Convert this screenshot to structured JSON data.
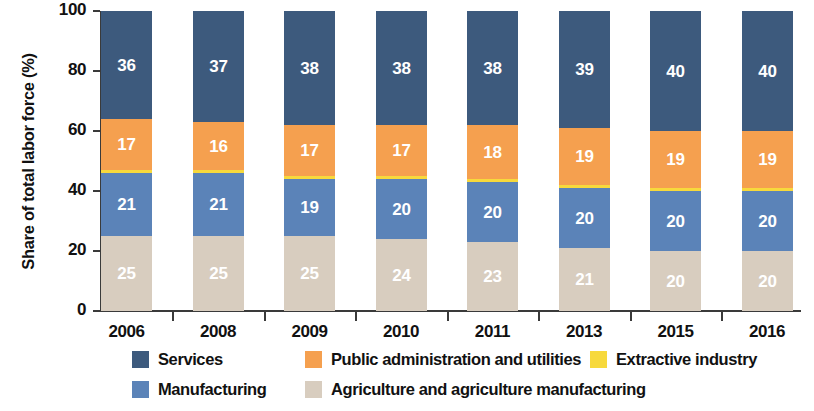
{
  "chart_data": {
    "type": "bar",
    "subtype": "stacked-bar-100-percent",
    "title": "",
    "xlabel": "",
    "ylabel": "Share of total labor force (%)",
    "ylim": [
      0,
      100
    ],
    "yticks": [
      0,
      20,
      40,
      60,
      80,
      100
    ],
    "grid": false,
    "legend_position": "bottom",
    "categories": [
      "2006",
      "2008",
      "2009",
      "2010",
      "2011",
      "2013",
      "2015",
      "2016"
    ],
    "stack_order_bottom_to_top": [
      "Agriculture and agriculture manufacturing",
      "Manufacturing",
      "Extractive industry",
      "Public administration and utilities",
      "Services"
    ],
    "series": [
      {
        "name": "Agriculture and agriculture manufacturing",
        "color": "#d8cdbf",
        "label_color": "#ffffff",
        "values": [
          25,
          25,
          25,
          24,
          23,
          21,
          20,
          20
        ],
        "show_labels": true
      },
      {
        "name": "Manufacturing",
        "color": "#5b83b8",
        "label_color": "#ffffff",
        "values": [
          21,
          21,
          19,
          20,
          20,
          20,
          20,
          20
        ],
        "show_labels": true
      },
      {
        "name": "Extractive industry",
        "color": "#f7d93c",
        "label_color": "#ffffff",
        "values": [
          1,
          1,
          1,
          1,
          1,
          1,
          1,
          1
        ],
        "show_labels": false
      },
      {
        "name": "Public administration and utilities",
        "color": "#f5a04f",
        "label_color": "#ffffff",
        "values": [
          17,
          16,
          17,
          17,
          18,
          19,
          19,
          19
        ],
        "show_labels": true
      },
      {
        "name": "Services",
        "color": "#3d5a7d",
        "label_color": "#ffffff",
        "values": [
          36,
          37,
          38,
          38,
          38,
          39,
          40,
          40
        ],
        "show_labels": true
      }
    ]
  },
  "legend": {
    "entries": [
      {
        "label": "Services",
        "color": "#3d5a7d",
        "row": 0,
        "col": 0
      },
      {
        "label": "Public administration and utilities",
        "color": "#f5a04f",
        "row": 0,
        "col": 1
      },
      {
        "label": "Extractive industry",
        "color": "#f7d93c",
        "row": 0,
        "col": 2
      },
      {
        "label": "Manufacturing",
        "color": "#5b83b8",
        "row": 1,
        "col": 0
      },
      {
        "label": "Agriculture and agriculture manufacturing",
        "color": "#d8cdbf",
        "row": 1,
        "col": 1
      }
    ]
  },
  "colors": {
    "services": "#3d5a7d",
    "public_administration": "#f5a04f",
    "extractive": "#f7d93c",
    "manufacturing": "#5b83b8",
    "agriculture": "#d8cdbf",
    "axis": "#3a3a3a",
    "text": "#111111",
    "background": "#ffffff"
  }
}
